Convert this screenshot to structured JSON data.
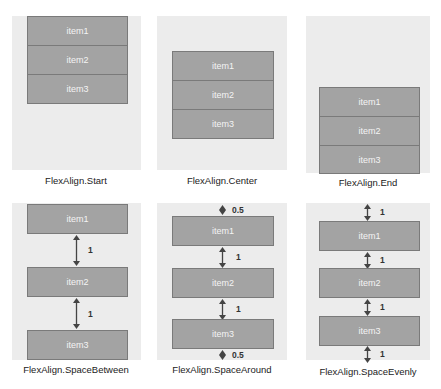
{
  "header_cutoff": "",
  "panels": [
    {
      "caption": "FlexAlign.Start",
      "items": [
        "item1",
        "item2",
        "item3"
      ]
    },
    {
      "caption": "FlexAlign.Center",
      "items": [
        "item1",
        "item2",
        "item3"
      ]
    },
    {
      "caption": "FlexAlign.End",
      "items": [
        "item1",
        "item2",
        "item3"
      ]
    },
    {
      "caption": "FlexAlign.SpaceBetween",
      "items": [
        "item1",
        "item2",
        "item3"
      ],
      "gaps": [
        "1",
        "1"
      ]
    },
    {
      "caption": "FlexAlign.SpaceAround",
      "items": [
        "item1",
        "item2",
        "item3"
      ],
      "gaps": [
        "0.5",
        "1",
        "1",
        "0.5"
      ]
    },
    {
      "caption": "FlexAlign.SpaceEvenly",
      "items": [
        "item1",
        "item2",
        "item3"
      ],
      "gaps": [
        "1",
        "1",
        "1",
        "1"
      ]
    }
  ],
  "colors": {
    "panel_bg": "#ececec",
    "item_bg": "#a3a3a3",
    "item_border": "#7a7a7a",
    "item_text": "#f4f4f4",
    "arrow": "#444444"
  }
}
